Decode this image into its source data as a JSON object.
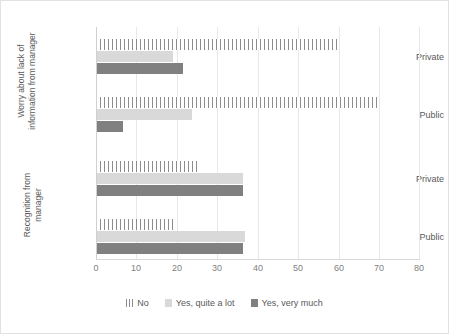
{
  "chart_data": {
    "type": "bar",
    "orientation": "horizontal",
    "title": "",
    "xlabel": "",
    "ylabel": "",
    "xlim": [
      0,
      80
    ],
    "xticks": [
      "0",
      "10",
      "20",
      "30",
      "40",
      "50",
      "60",
      "70",
      "80"
    ],
    "grid": true,
    "legend_position": "bottom",
    "legend": [
      "No",
      "Yes, quite a lot",
      "Yes, very much"
    ],
    "series": [
      {
        "name": "No",
        "color": "#8c8c8c",
        "pattern": "vertical-hatch",
        "values": [
          59.5,
          69.5,
          25.0,
          19.0
        ]
      },
      {
        "name": "Yes, quite a lot",
        "color": "#d9d9d9",
        "pattern": "solid",
        "values": [
          19.0,
          23.7,
          36.3,
          36.8
        ]
      },
      {
        "name": "Yes, very much",
        "color": "#808080",
        "pattern": "solid",
        "values": [
          21.5,
          6.7,
          36.3,
          36.3
        ]
      }
    ],
    "groups": [
      {
        "title": "Worry about lack of information from manager",
        "categories": [
          "Private",
          "Public"
        ]
      },
      {
        "title": "Recognition from manager",
        "categories": [
          "Private",
          "Public"
        ]
      }
    ],
    "categories": [
      "Private",
      "Public",
      "Private",
      "Public"
    ]
  },
  "colors": {
    "no": "#8c8c8c",
    "quite_a_lot": "#d9d9d9",
    "very_much": "#808080",
    "grid": "#e8e8e8",
    "text": "#595959",
    "tick_text": "#808080",
    "border": "#e2e2e2"
  }
}
